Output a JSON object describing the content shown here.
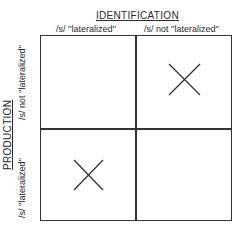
{
  "diagram": {
    "column_axis_title": "IDENTIFICATION",
    "row_axis_title": "PRODUCTION",
    "columns": [
      "/s/ ''lateralized''",
      "/s/ not ''lateralized''"
    ],
    "rows": [
      "/s/ not ''lateralized''",
      "/s/ ''lateralized''"
    ],
    "cells": [
      [
        {
          "mark": ""
        },
        {
          "mark": "X"
        }
      ],
      [
        {
          "mark": "X"
        },
        {
          "mark": ""
        }
      ]
    ],
    "mark_icon": "x-cross-icon",
    "line_color": "#333333"
  }
}
